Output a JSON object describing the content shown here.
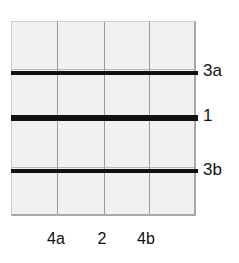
{
  "figure": {
    "type": "technical-grid-diagram",
    "background_color": "#ffffff",
    "panel": {
      "fill_color": "#ececec",
      "border_color": "#a8a8a8",
      "gridline_color": "#9a9a9a",
      "x": 11,
      "y": 21,
      "width": 185,
      "height": 195,
      "columns": 4,
      "rows": 4
    },
    "vertical_gridlines": [
      {
        "name": "vertical-gridline-1",
        "x": 45
      },
      {
        "name": "vertical-gridline-2",
        "x": 92
      },
      {
        "name": "vertical-gridline-3",
        "x": 137
      }
    ],
    "faint_horizontal_gridlines": [
      {
        "name": "faint-gridline-1",
        "y": 47
      },
      {
        "name": "faint-gridline-2",
        "y": 96
      },
      {
        "name": "faint-gridline-3",
        "y": 145
      }
    ],
    "bold_lines": [
      {
        "id": "line-3a",
        "label": "3a",
        "y": 49,
        "thickness": 4,
        "color": "#111111"
      },
      {
        "id": "line-1",
        "label": "1",
        "y": 93,
        "thickness": 6,
        "color": "#111111"
      },
      {
        "id": "line-3b",
        "label": "3b",
        "y": 147,
        "thickness": 4,
        "color": "#111111"
      }
    ],
    "row_labels": [
      {
        "id": "row-label-3a",
        "text": "3a",
        "x": 203,
        "y": 62
      },
      {
        "id": "row-label-1",
        "text": "1",
        "x": 203,
        "y": 107
      },
      {
        "id": "row-label-3b",
        "text": "3b",
        "x": 203,
        "y": 161
      }
    ],
    "column_labels": [
      {
        "id": "col-label-4a",
        "text": "4a",
        "center_x": 56,
        "y": 231
      },
      {
        "id": "col-label-2",
        "text": "2",
        "center_x": 102,
        "y": 231
      },
      {
        "id": "col-label-4b",
        "text": "4b",
        "center_x": 146,
        "y": 231
      }
    ]
  }
}
